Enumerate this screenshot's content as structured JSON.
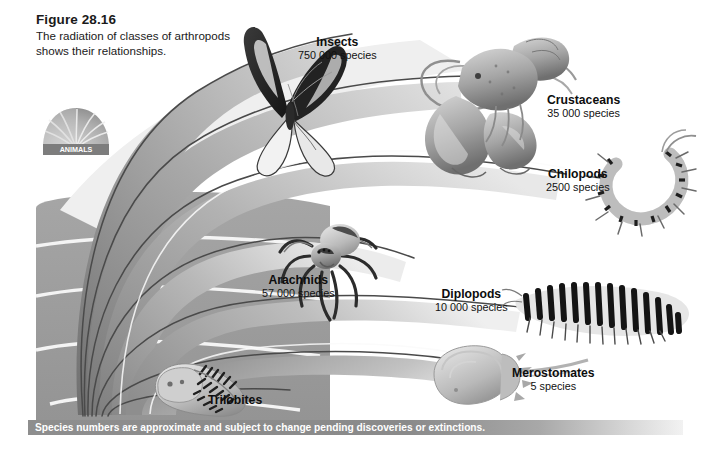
{
  "figure": {
    "number": "Figure 28.16",
    "description": "The radiation of classes of arthropods shows their relationships.",
    "badge_label": "ANIMALS",
    "note": "Species numbers are approximate and subject to change pending discoveries or extinctions."
  },
  "taxa": [
    {
      "name": "Insects",
      "species": "750 000 species",
      "icon": "butterfly-illustration"
    },
    {
      "name": "Crustaceans",
      "species": "35 000 species",
      "icon": "lobster-illustration"
    },
    {
      "name": "Chilopods",
      "species": "2500 species",
      "icon": "centipede-illustration"
    },
    {
      "name": "Arachnids",
      "species": "57 000 species",
      "icon": "spider-illustration"
    },
    {
      "name": "Diplopods",
      "species": "10 000 species",
      "icon": "millipede-illustration"
    },
    {
      "name": "Merostomates",
      "species": "5 species",
      "icon": "horseshoe-crab-illustration"
    },
    {
      "name": "Trilobites",
      "species": "",
      "icon": "trilobite-illustration"
    }
  ],
  "colors": {
    "band_dark": "#7f7f7f",
    "band_mid": "#9a9a9a",
    "band_light": "#c3c3c3",
    "background_block": "#9c9c9c",
    "note_bar": "#8e8e8e",
    "text": "#111111"
  }
}
